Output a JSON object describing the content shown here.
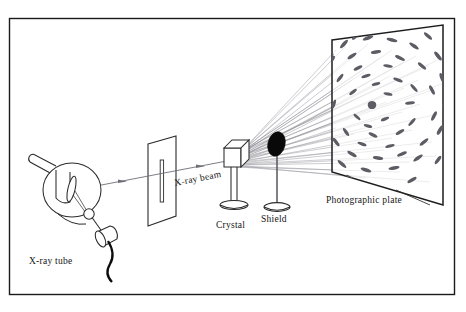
{
  "figure": {
    "border_color": "#1a1a1a",
    "background_color": "#ffffff",
    "frame": {
      "x": 9,
      "y": 18,
      "width": 446,
      "height": 277
    }
  },
  "labels": {
    "xray_tube": "X-ray tube",
    "xray_beam": "X-ray beam",
    "crystal": "Crystal",
    "shield": "Shield",
    "photographic_plate": "Photographic plate"
  },
  "colors": {
    "outline": "#2b2b2b",
    "beam_line": "#6e6e78",
    "ray_fan": "#8a8a92",
    "spot_fill": "#585860",
    "shield_fill": "#0a0a0a",
    "center_spot_fill": "#5a5a62",
    "text": "#151515"
  },
  "components": {
    "xray_tube": {
      "name": "x-ray-tube",
      "bulb_center": [
        72,
        190
      ],
      "bulb_radius_x": 29,
      "bulb_radius_y": 27,
      "side_arm": "upper-left neck",
      "anode_target": "tilted ellipse inside bulb",
      "filament": "small circle",
      "cathode": "cylinder with lead wire"
    },
    "collimator": {
      "name": "collimator-plate",
      "slit_orientation": "vertical",
      "plate_corners": [
        [
          148,
          144
        ],
        [
          176,
          136
        ],
        [
          176,
          216
        ],
        [
          148,
          226
        ]
      ]
    },
    "crystal": {
      "name": "crystal-specimen",
      "shape": "cube",
      "cube_size": 19,
      "mounted_on": "post with elliptical base"
    },
    "shield": {
      "name": "beam-shield",
      "shape": "solid black ellipse",
      "mounted_on": "thin post with elliptical base"
    },
    "photographic_plate": {
      "name": "photographic-plate",
      "plate_corners": [
        [
          332,
          40
        ],
        [
          443,
          25
        ],
        [
          443,
          205
        ],
        [
          332,
          172
        ]
      ],
      "center_spot": {
        "cx": 372,
        "cy": 105,
        "r": 4.2
      }
    }
  },
  "beam": {
    "name": "x-ray-beam",
    "start": [
      72,
      190
    ],
    "end": [
      232,
      160
    ],
    "arrow_count": 2,
    "diffracted_ray_count": 34
  },
  "diffraction_spots": {
    "count": 52,
    "description": "elongated dash-shaped Laue spots in concentric rings"
  }
}
